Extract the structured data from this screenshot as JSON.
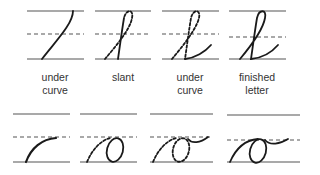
{
  "top_row": {
    "steps": [
      {
        "line1": "under",
        "line2": "curve"
      },
      {
        "line1": "slant",
        "line2": ""
      },
      {
        "line1": "under",
        "line2": "curve"
      },
      {
        "line1": "finished",
        "line2": "letter"
      }
    ]
  },
  "colors": {
    "stroke": "#1a1a1a",
    "rule": "#555555"
  }
}
